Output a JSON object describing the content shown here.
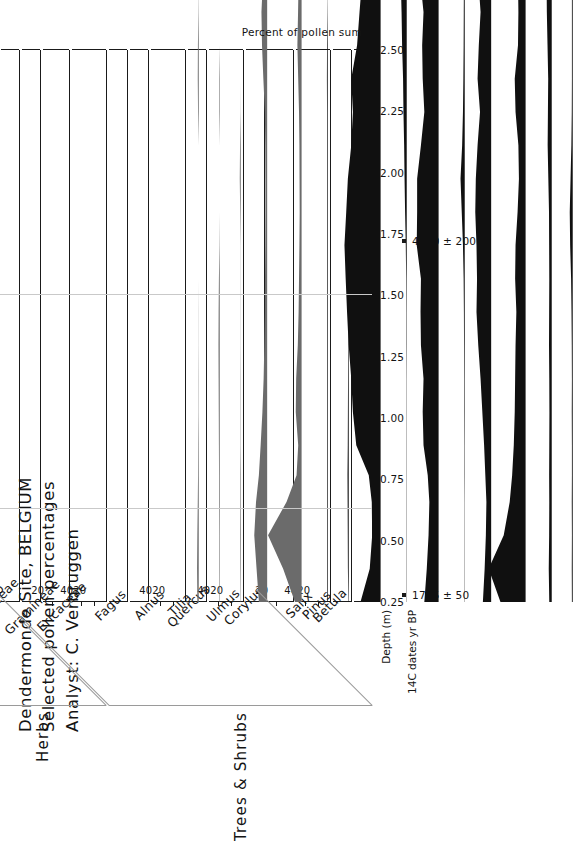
{
  "title": {
    "line1": "Dendermonde Site, BELGIUM",
    "line2": "Selected pollen percentages",
    "line3": "Analyst: C. Verbruggen"
  },
  "axes": {
    "depth_label": "Depth (m)",
    "c14_label": "14C dates yr BP",
    "percent_label": "Percent of pollen sum",
    "depth_ticks": [
      "0.25",
      "0.50",
      "0.75",
      "1.00",
      "1.25",
      "1.50",
      "1.75",
      "2.00",
      "2.25",
      "2.50"
    ],
    "depth_min": 0.25,
    "depth_max": 2.5
  },
  "c14_dates": [
    {
      "label": "1785 ± 50",
      "depth": 0.28
    },
    {
      "label": "4170 ± 200",
      "depth": 1.72
    }
  ],
  "groups": [
    {
      "label": "Trees & Shrubs",
      "from_taxon": "Betula",
      "to_taxon": "Fagus"
    },
    {
      "label": "Herbs",
      "from_taxon": "Gramineae",
      "to_taxon": "Cerealia"
    }
  ],
  "zone": {
    "title": "Zone",
    "zones": [
      {
        "label": "1a",
        "from_depth": 2.5,
        "to_depth": 1.5
      },
      {
        "label": "1b",
        "from_depth": 1.5,
        "to_depth": 0.63
      },
      {
        "label": "2",
        "from_depth": 0.63,
        "to_depth": 0.25
      }
    ]
  },
  "summary_panel": {
    "label": "AP & NAP",
    "ticks": [
      "20",
      "40",
      "60",
      "80",
      "100"
    ],
    "tick_values": [
      20,
      40,
      60,
      80,
      100
    ],
    "max": 110
  },
  "chart_data": {
    "type": "area",
    "xlabel": "Percent of pollen sum",
    "ylabel": "Depth (m)",
    "depths": [
      0.25,
      0.35,
      0.45,
      0.55,
      0.63,
      0.72,
      0.82,
      0.92,
      1.02,
      1.12,
      1.22,
      1.32,
      1.42,
      1.52,
      1.62,
      1.72,
      1.82,
      1.92,
      2.02,
      2.12,
      2.22,
      2.32,
      2.4
    ],
    "series": [
      {
        "name": "Betula",
        "group": "Trees & Shrubs",
        "ticks": [
          "",
          ""
        ],
        "tick_values": [],
        "max": 30,
        "values": [
          1.0,
          1.2,
          1.0,
          1.2,
          1.0,
          1.0,
          1.2,
          1.0,
          1.2,
          1.5,
          2.0,
          3.2,
          3.6,
          2.6,
          1.6,
          1.2,
          1.0,
          1.0,
          1.0,
          1.0,
          1.2,
          1.0,
          1.0
        ]
      },
      {
        "name": "Pinus",
        "group": "Trees & Shrubs",
        "ticks": [],
        "tick_values": [],
        "max": 30,
        "values": [
          3.0,
          3.6,
          3.2,
          3.0,
          3.2,
          3.0,
          2.8,
          3.0,
          3.4,
          3.2,
          3.0,
          3.2,
          3.4,
          4.2,
          5.0,
          4.6,
          4.4,
          5.2,
          6.0,
          6.4,
          5.6,
          4.6,
          4.0
        ]
      },
      {
        "name": "Salix",
        "group": "Trees & Shrubs",
        "ticks": [
          "20",
          "40"
        ],
        "tick_values": [
          20,
          40
        ],
        "max": 55,
        "values": [
          30.0,
          44.0,
          26.0,
          19.0,
          16.0,
          14.0,
          13.0,
          12.5,
          12.0,
          11.0,
          12.5,
          12.0,
          9.5,
          8.0,
          8.5,
          12.0,
          13.0,
          9.0,
          8.5,
          9.0,
          9.5,
          9.0,
          9.5
        ]
      },
      {
        "name": "Corylus",
        "group": "Trees & Shrubs",
        "ticks": [
          "20"
        ],
        "tick_values": [
          20
        ],
        "max": 30,
        "values": [
          7.0,
          5.5,
          4.5,
          4.0,
          5.0,
          6.0,
          7.5,
          9.0,
          11.0,
          12.5,
          12.0,
          12.5,
          13.5,
          13.0,
          11.5,
          9.5,
          11.5,
          10.5,
          9.0,
          11.0,
          14.0,
          12.0,
          11.0
        ]
      },
      {
        "name": "Ulmus",
        "group": "Trees & Shrubs",
        "ticks": [],
        "tick_values": [],
        "max": 30,
        "values": [
          0.4,
          0.4,
          0.4,
          0.4,
          0.5,
          0.5,
          0.6,
          0.6,
          0.8,
          1.0,
          1.4,
          2.2,
          3.6,
          5.2,
          3.2,
          2.2,
          1.6,
          1.4,
          1.2,
          1.0,
          0.8,
          0.6,
          0.6
        ]
      },
      {
        "name": "Quercus",
        "group": "Trees & Shrubs",
        "ticks": [
          "20",
          "40"
        ],
        "tick_values": [
          20,
          40
        ],
        "max": 55,
        "values": [
          17.0,
          14.0,
          12.0,
          11.0,
          13.0,
          18.0,
          19.0,
          18.0,
          21.0,
          21.5,
          21.0,
          26.0,
          25.5,
          25.5,
          21.0,
          17.0,
          19.0,
          19.5,
          18.0,
          22.0,
          27.0,
          22.0,
          19.0
        ]
      },
      {
        "name": "Tilia",
        "group": "Trees & Shrubs",
        "ticks": [],
        "tick_values": [],
        "max": 30,
        "values": [
          0.3,
          0.3,
          0.3,
          0.3,
          0.3,
          0.4,
          0.4,
          0.4,
          0.5,
          0.5,
          0.6,
          1.2,
          2.0,
          2.6,
          3.2,
          4.0,
          4.5,
          5.6,
          6.4,
          7.4,
          7.0,
          6.5,
          6.2
        ]
      },
      {
        "name": "Alnus",
        "group": "Trees & Shrubs",
        "ticks": [
          "20",
          "40"
        ],
        "tick_values": [
          20,
          40
        ],
        "max": 55,
        "values": [
          24.0,
          13.0,
          10.0,
          10.5,
          14.0,
          29.0,
          33.0,
          35.0,
          38.0,
          40.0,
          41.5,
          43.0,
          41.0,
          39.0,
          35.0,
          33.0,
          35.0,
          28.0,
          25.0,
          22.0,
          18.0,
          21.0,
          28.0
        ]
      },
      {
        "name": "Fagus",
        "group": "Trees & Shrubs",
        "ticks": [],
        "tick_values": [],
        "max": 30,
        "values": [
          0.5,
          1.0,
          1.2,
          1.4,
          1.5,
          1.2,
          1.0,
          0.8,
          0.6,
          0.4,
          0.3,
          0.2,
          0.1,
          0.0,
          0.0,
          0.0,
          0.0,
          0.0,
          0.0,
          0.0,
          0.0,
          0.0,
          0.0
        ]
      },
      {
        "name": "Ericaceae",
        "group": "Trees & Shrubs",
        "ticks": [],
        "tick_values": [],
        "max": 30,
        "values": [
          0.8,
          0.8,
          0.8,
          0.8,
          0.8,
          0.8,
          0.8,
          0.8,
          0.8,
          0.8,
          0.8,
          0.8,
          0.8,
          0.8,
          0.8,
          0.8,
          1.0,
          0.8,
          0.3,
          0.0,
          0.3,
          0.3,
          0.3
        ]
      },
      {
        "name": "Gramineae",
        "group": "Herbs",
        "ticks": [
          "20",
          "40"
        ],
        "tick_values": [
          20,
          40
        ],
        "max": 55,
        "values": [
          8.0,
          22.0,
          40.0,
          18.0,
          6.0,
          4.0,
          7.0,
          6.5,
          4.5,
          3.5,
          3.0,
          2.6,
          2.2,
          2.4,
          2.6,
          3.0,
          4.0,
          5.0,
          4.2,
          3.6,
          3.8,
          4.2,
          4.6
        ]
      },
      {
        "name": "Cyperaceae",
        "group": "Herbs",
        "ticks": [
          "20"
        ],
        "tick_values": [
          20
        ],
        "max": 30,
        "values": [
          7.0,
          9.0,
          11.0,
          9.5,
          7.0,
          5.5,
          4.0,
          3.0,
          2.4,
          2.0,
          1.8,
          1.6,
          1.5,
          1.5,
          1.6,
          2.0,
          3.2,
          4.4,
          4.8,
          3.6,
          3.2,
          3.6,
          3.0
        ]
      },
      {
        "name": "Plantago",
        "group": "Herbs",
        "ticks": [],
        "tick_values": [],
        "max": 30,
        "values": [
          0.4,
          0.6,
          0.8,
          0.7,
          0.6,
          0.4,
          0.3,
          0.3,
          0.2,
          0.2,
          0.2,
          0.2,
          0.6,
          1.2,
          0.8,
          0.2,
          0.0,
          0.0,
          0.0,
          0.0,
          0.0,
          0.0,
          0.0
        ]
      },
      {
        "name": "Rumex",
        "group": "Herbs",
        "ticks": [],
        "tick_values": [],
        "max": 30,
        "values": [
          0.5,
          0.6,
          0.7,
          0.8,
          0.9,
          1.0,
          1.2,
          1.4,
          1.5,
          1.4,
          1.0,
          0.4,
          0.0,
          0.0,
          0.0,
          0.6,
          0.6,
          0.0,
          0.0,
          0.0,
          0.0,
          0.0,
          0.0
        ]
      },
      {
        "name": "Cerealia",
        "group": "Herbs",
        "ticks": [],
        "tick_values": [],
        "max": 30,
        "values": [
          1.6,
          2.0,
          1.6,
          1.2,
          0.8,
          0.6,
          0.4,
          0.3,
          0.2,
          0.1,
          0.0,
          0.0,
          0.0,
          0.0,
          0.0,
          0.8,
          1.2,
          1.0,
          0.4,
          0.0,
          0.0,
          0.0,
          0.0
        ]
      }
    ],
    "ap_nap": {
      "name": "AP & NAP",
      "ap_values": [
        80,
        56,
        41,
        64,
        73,
        76,
        78,
        80,
        84,
        86,
        87,
        89,
        92,
        91,
        88,
        85,
        87,
        86,
        83,
        86,
        89,
        86,
        90
      ],
      "max": 110,
      "ap_color": "#9d9d9d",
      "nap_color": "#f2f2ee"
    }
  }
}
